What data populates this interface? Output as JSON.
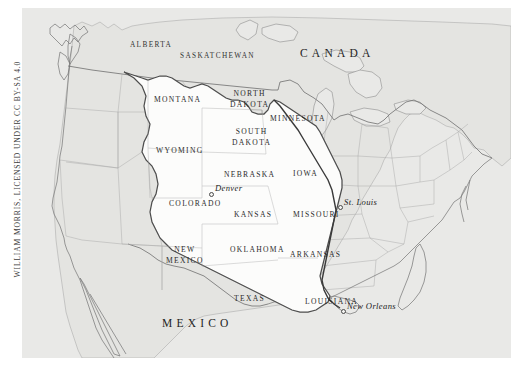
{
  "attribution": {
    "text": "WILLIAM MORRIS, LICENSED UNDER CC BY-SA 4.0"
  },
  "map": {
    "title": "Louisiana Purchase territory map of North America",
    "background_color": "#e9e9e7",
    "highlight_color": "#fdfdfc",
    "border_color": "#8e8e8e",
    "purchase_outline_color": "#4a4a4a",
    "page_background": "#ffffff",
    "countries": [
      {
        "name": "CANADA",
        "x": 278,
        "y": 40
      },
      {
        "name": "MEXICO",
        "x": 140,
        "y": 310
      }
    ],
    "provinces": [
      {
        "name": "ALBERTA",
        "x": 108,
        "y": 33
      },
      {
        "name": "SASKATCHEWAN",
        "x": 158,
        "y": 44
      }
    ],
    "states": [
      {
        "name": "MONTANA",
        "lines": [
          "MONTANA"
        ],
        "x": 132,
        "y": 88
      },
      {
        "name": "NORTH DAKOTA",
        "lines": [
          "NORTH",
          "DAKOTA"
        ],
        "x": 208,
        "y": 86
      },
      {
        "name": "MINNESOTA",
        "lines": [
          "MINNESOTA"
        ],
        "x": 250,
        "y": 107
      },
      {
        "name": "SOUTH DAKOTA",
        "lines": [
          "SOUTH",
          "DAKOTA"
        ],
        "x": 208,
        "y": 123
      },
      {
        "name": "WYOMING",
        "lines": [
          "WYOMING"
        ],
        "x": 140,
        "y": 139
      },
      {
        "name": "NEBRASKA",
        "lines": [
          "NEBRASKA"
        ],
        "x": 205,
        "y": 163
      },
      {
        "name": "IOWA",
        "lines": [
          "IOWA"
        ],
        "x": 273,
        "y": 162
      },
      {
        "name": "COLORADO",
        "lines": [
          "COLORADO"
        ],
        "x": 155,
        "y": 192
      },
      {
        "name": "KANSAS",
        "lines": [
          "KANSAS"
        ],
        "x": 219,
        "y": 203
      },
      {
        "name": "MISSOURI",
        "lines": [
          "MISSOURI"
        ],
        "x": 277,
        "y": 203
      },
      {
        "name": "OKLAHOMA",
        "lines": [
          "OKLAHOMA"
        ],
        "x": 219,
        "y": 238
      },
      {
        "name": "ARKANSAS",
        "lines": [
          "ARKANSAS"
        ],
        "x": 277,
        "y": 243
      },
      {
        "name": "NEW MEXICO",
        "lines": [
          "NEW",
          "MEXICO"
        ],
        "x": 152,
        "y": 241
      },
      {
        "name": "TEXAS",
        "lines": [
          "TEXAS"
        ],
        "x": 216,
        "y": 287
      },
      {
        "name": "LOUISIANA",
        "lines": [
          "LOUISIANA"
        ],
        "x": 292,
        "y": 290
      }
    ],
    "cities": [
      {
        "name": "Denver",
        "x": 192,
        "y": 180,
        "dot_x": 187,
        "dot_y": 184
      },
      {
        "name": "St. Louis",
        "x": 322,
        "y": 194,
        "dot_x": 316,
        "dot_y": 197
      },
      {
        "name": "New Orleans",
        "x": 325,
        "y": 297,
        "dot_x": 319,
        "dot_y": 301
      }
    ]
  }
}
